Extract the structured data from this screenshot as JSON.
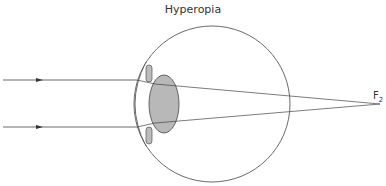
{
  "title": "Hyperopia",
  "focal_point": {
    "label": "F",
    "subscript": "2"
  },
  "colors": {
    "line": "#444444",
    "lens_fill": "#b8b8b8",
    "lens_stroke": "#555555",
    "iris_fill": "#bbbbbb"
  },
  "diagram": {
    "eyeball": {
      "cx": 212,
      "cy": 104,
      "r": 78
    },
    "lens": {
      "cx": 164,
      "cy": 104,
      "rx": 15,
      "ry": 29
    },
    "rays": [
      {
        "y": 80,
        "enter_x": 137
      },
      {
        "y": 127,
        "enter_x": 137
      }
    ],
    "focus": {
      "x": 380,
      "y": 104
    }
  }
}
